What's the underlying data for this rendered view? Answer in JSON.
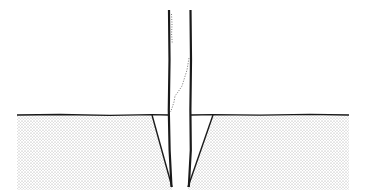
{
  "diagram": {
    "type": "cross-section",
    "colors": {
      "background": "#ffffff",
      "ink": "#1a1a1a",
      "stipple": "#9a9a9a"
    },
    "ground": {
      "surface_y": 115,
      "bottom_y": 190,
      "left_x": 17,
      "right_x": 349
    },
    "posts": [
      {
        "name": "left-post",
        "x": 169,
        "top_y": 10,
        "bottom_y": 187
      },
      {
        "name": "right-post",
        "x": 191,
        "top_y": 10,
        "bottom_y": 187
      }
    ],
    "wedges": [
      {
        "name": "left-wedge",
        "top_outer_x": 152,
        "tip_x": 172,
        "tip_y": 187
      },
      {
        "name": "right-wedge",
        "top_outer_x": 213,
        "tip_x": 188,
        "tip_y": 187
      }
    ]
  }
}
